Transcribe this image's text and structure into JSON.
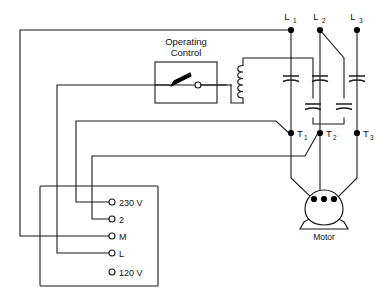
{
  "diagram": {
    "line_terminals": [
      {
        "id": "L1",
        "label": "L",
        "subscript": "1"
      },
      {
        "id": "L2",
        "label": "L",
        "subscript": "2"
      },
      {
        "id": "L3",
        "label": "L",
        "subscript": "3"
      }
    ],
    "motor_terminals": [
      {
        "id": "T1",
        "label": "T",
        "subscript": "1"
      },
      {
        "id": "T2",
        "label": "T",
        "subscript": "2"
      },
      {
        "id": "T3",
        "label": "T",
        "subscript": "3"
      }
    ],
    "control_box": {
      "title_line1": "Operating",
      "title_line2": "Control",
      "component": "switch"
    },
    "coil": {
      "name": "relay-coil"
    },
    "motor": {
      "label": "Motor",
      "terminal_count": 3
    },
    "terminal_block": {
      "terminals": [
        {
          "label": "230 V",
          "connected": true
        },
        {
          "label": "2",
          "connected": true
        },
        {
          "label": "M",
          "connected": true
        },
        {
          "label": "L",
          "connected": true
        },
        {
          "label": "120 V",
          "connected": false
        }
      ]
    },
    "capacitors": {
      "count": 5,
      "on_lines": [
        "L1",
        "L2",
        "L3"
      ],
      "cross_connected": 2
    },
    "colors": {
      "wire": "#1a1a1a",
      "background": "#ffffff",
      "node": "#000000",
      "text": "#111111"
    }
  }
}
